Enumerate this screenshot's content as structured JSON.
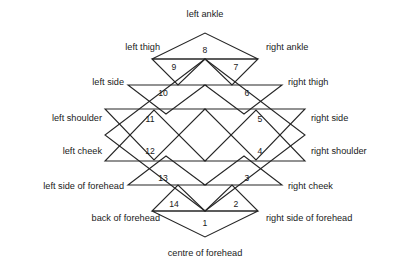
{
  "figure": {
    "title": "",
    "stroke_color": "#262626",
    "text_color": "#1a1a1a",
    "background": "#ffffff",
    "shape": "star-diamond-with-14-triangles"
  },
  "labels": {
    "top": {
      "text": "left ankle",
      "align": "center"
    },
    "bottom": {
      "text": "centre of forehead",
      "align": "center"
    },
    "left": [
      {
        "text": "left thigh"
      },
      {
        "text": "left side"
      },
      {
        "text": "left shoulder"
      },
      {
        "text": "left cheek"
      },
      {
        "text": "left side of forehead"
      },
      {
        "text": "back of forehead"
      }
    ],
    "right": [
      {
        "text": "right ankle"
      },
      {
        "text": "right thigh"
      },
      {
        "text": "right side"
      },
      {
        "text": "right shoulder"
      },
      {
        "text": "right cheek"
      },
      {
        "text": "right side of forehead"
      }
    ]
  },
  "triangles": [
    {
      "number": "1",
      "label": "centre of forehead"
    },
    {
      "number": "2",
      "label": "right side of forehead"
    },
    {
      "number": "3",
      "label": "right cheek"
    },
    {
      "number": "4",
      "label": "right shoulder"
    },
    {
      "number": "5",
      "label": "right side"
    },
    {
      "number": "6",
      "label": "right thigh"
    },
    {
      "number": "7",
      "label": "right ankle"
    },
    {
      "number": "8",
      "label": "left ankle"
    },
    {
      "number": "9",
      "label": "left thigh"
    },
    {
      "number": "10",
      "label": "left side"
    },
    {
      "number": "11",
      "label": "left shoulder"
    },
    {
      "number": "12",
      "label": "left cheek"
    },
    {
      "number": "13",
      "label": "left side of forehead"
    },
    {
      "number": "14",
      "label": "back of forehead"
    }
  ]
}
